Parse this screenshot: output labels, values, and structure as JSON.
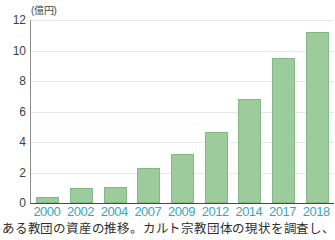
{
  "chart_data": {
    "type": "bar",
    "title": "",
    "subtitle": "",
    "unit_label": "(億円)",
    "xlabel": "",
    "ylabel": "",
    "categories": [
      "2000",
      "2002",
      "2004",
      "2007",
      "2009",
      "2012",
      "2014",
      "2017",
      "2018"
    ],
    "values": [
      0.4,
      1.0,
      1.05,
      2.3,
      3.2,
      4.65,
      6.8,
      9.5,
      11.2
    ],
    "ylim": [
      0,
      12
    ],
    "yticks": [
      0,
      2,
      4,
      6,
      8,
      10,
      12
    ],
    "ytick_labels": [
      "0",
      "2",
      "4",
      "6",
      "8",
      "10",
      "12"
    ],
    "grid": true,
    "legend": false,
    "legend_position": "none",
    "bar_color": "#9ccb9c",
    "bar_border_color": "#86b887",
    "xtick_color": "#3ba5b6",
    "ytick_color": "#3f3f3f",
    "gridline_color": "#e4eae4",
    "axis_color": "#4a4a4a"
  },
  "caption": {
    "text": "ある教団の資産の推移。カルト宗教団体の現状を調査し、公表。"
  }
}
